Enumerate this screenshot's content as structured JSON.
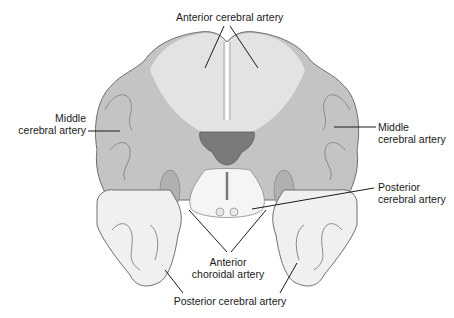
{
  "figure": {
    "colors": {
      "background": "#ffffff",
      "anterior_territory": "#e6e6e6",
      "middle_territory": "#c4c4c4",
      "posterior_territory": "#f0f0f0",
      "cortex_band": "#d2d2d2",
      "ventricle": "#7a7a7a",
      "outline": "#6e6e6e",
      "leader_line": "#1a1a1a",
      "text": "#1a1a1a"
    }
  },
  "labels": {
    "anterior_cerebral": "Anterior cerebral artery",
    "middle_left_line1": "Middle",
    "middle_left_line2": "cerebral artery",
    "middle_right_line1": "Middle",
    "middle_right_line2": "cerebral artery",
    "posterior_right_line1": "Posterior",
    "posterior_right_line2": "cerebral artery",
    "anterior_choroidal_line1": "Anterior",
    "anterior_choroidal_line2": "choroidal artery",
    "posterior_bottom": "Posterior cerebral artery"
  }
}
